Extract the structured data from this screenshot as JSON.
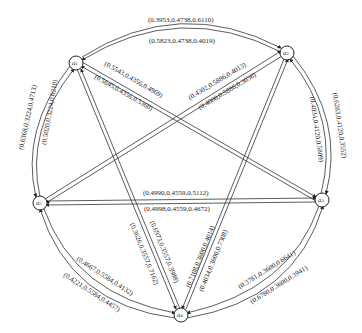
{
  "nodes": [
    {
      "id": "a1",
      "label": "a₁",
      "x": 76,
      "y": 63
    },
    {
      "id": "a2",
      "label": "a₂",
      "x": 287,
      "y": 53
    },
    {
      "id": "a3",
      "label": "a₃",
      "x": 322,
      "y": 200
    },
    {
      "id": "a4",
      "label": "a₄",
      "x": 181,
      "y": 315
    },
    {
      "id": "a5",
      "label": "a₅",
      "x": 40,
      "y": 203
    }
  ],
  "edges": {
    "a1_a2_outer": "(0.3953,0.4738,0.6110)",
    "a1_a2_inner": "(0.5823,0.4738,0.4019)",
    "a1_a3_upper": "(0.5543,0.4356,0.4969)",
    "a1_a3_lower": "(0.5645,0.4356,0.5360)",
    "a5_a2_upper": "(0.4302,0.5886,0.4013)",
    "a5_a2_lower": "(0.4000,0.5886,0.3036)",
    "a1_a5_outer": "(0.6368,0.3224,0.4713)",
    "a1_a5_inner": "(0.5020,0.3224,0.6210)",
    "a2_a3_outer": "(0.6283,0.4120,0.3552)",
    "a2_a3_inner": "(0.4034,0.4120,0.5809)",
    "a5_a3_upper": "(0.4990,0.4559,0.5112)",
    "a5_a3_lower": "(0.4998,0.4559,0.4672)",
    "a1_a4_left": "(0.3626,0.3557,0.7162)",
    "a1_a4_right": "(0.6973,0.3557,0.3988)",
    "a2_a4_left": "(0.7108,0.3600,0.4014)",
    "a2_a4_right": "(0.4034,0.3600,0.7308)",
    "a5_a4_inner": "(0.4667,0.5584,0.4132)",
    "a5_a4_outer": "(0.4221,0.5584,0.4457)",
    "a3_a4_inner": "(0.3781,0.3600,0.6641)",
    "a3_a4_outer": "(0.6780,0.3600,0.3941)"
  },
  "colors": {
    "line": "#333333",
    "text": "#222222",
    "background": "#ffffff"
  }
}
